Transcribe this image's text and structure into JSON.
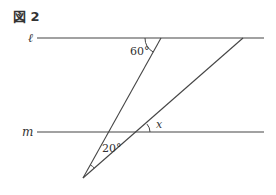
{
  "figure": {
    "title": "図 2"
  },
  "lines": {
    "l_label": "ℓ",
    "m_label": "m"
  },
  "angles": {
    "top": "60°",
    "apex": "20°",
    "unknown": "x"
  },
  "colors": {
    "stroke": "#444444",
    "text": "#333333"
  }
}
